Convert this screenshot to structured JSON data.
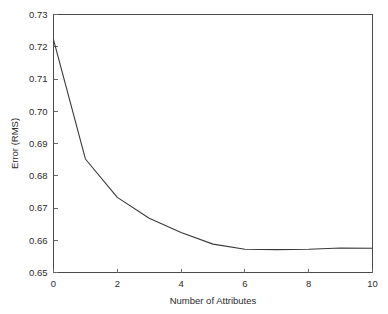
{
  "chart_data": {
    "type": "line",
    "title": "",
    "xlabel": "Number of Attributes",
    "ylabel": "Error (RMS)",
    "xlim": [
      0,
      10
    ],
    "ylim": [
      0.65,
      0.73
    ],
    "grid": false,
    "legend": null,
    "x": [
      0,
      1,
      2,
      3,
      4,
      5,
      6,
      7,
      8,
      9,
      10
    ],
    "values": [
      0.7222,
      0.6852,
      0.6733,
      0.6668,
      0.6624,
      0.6588,
      0.6572,
      0.6571,
      0.6572,
      0.6576,
      0.6575
    ],
    "series": [
      {
        "name": "Error (RMS)",
        "values": [
          0.7222,
          0.6852,
          0.6733,
          0.6668,
          0.6624,
          0.6588,
          0.6572,
          0.6571,
          0.6572,
          0.6576,
          0.6575
        ]
      }
    ],
    "xticks": [
      0,
      2,
      4,
      6,
      8,
      10
    ],
    "xtick_labels": [
      "0",
      "2",
      "4",
      "6",
      "8",
      "10"
    ],
    "yticks": [
      0.65,
      0.66,
      0.67,
      0.68,
      0.69,
      0.7,
      0.71,
      0.72,
      0.73
    ],
    "ytick_labels": [
      "0.65",
      "0.66",
      "0.67",
      "0.68",
      "0.69",
      "0.70",
      "0.71",
      "0.72",
      "0.73"
    ],
    "line_color": "#3a3a3a",
    "axis_color": "#4a4a4a",
    "background_color": "#ffffff"
  }
}
